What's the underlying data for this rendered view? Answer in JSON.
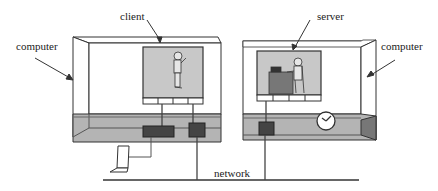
{
  "diagram": {
    "labels": {
      "client": "client",
      "server": "server",
      "computer_left": "computer",
      "computer_right": "computer",
      "network": "network"
    },
    "colors": {
      "line": "#333333",
      "panel_fill": "#c8c8c8",
      "floor_fill": "#b4b4b4",
      "device_fill": "#444444",
      "background": "#ffffff"
    },
    "nodes": [
      {
        "id": "computer-left",
        "type": "computer",
        "contains": [
          "client",
          "network-device-1",
          "network-device-2"
        ]
      },
      {
        "id": "computer-right",
        "type": "computer",
        "contains": [
          "server",
          "network-device-3",
          "clock"
        ]
      },
      {
        "id": "laptop",
        "type": "terminal"
      },
      {
        "id": "network",
        "type": "bus"
      }
    ],
    "edges": [
      {
        "from": "laptop",
        "to": "network-device-1"
      },
      {
        "from": "network-device-2",
        "to": "network"
      },
      {
        "from": "network-device-3",
        "to": "network"
      }
    ]
  }
}
